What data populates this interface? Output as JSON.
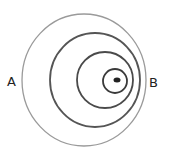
{
  "diagram": {
    "type": "nested-eccentric-circles",
    "labels": {
      "left": "A",
      "right": "B"
    },
    "circles": [
      {
        "name": "outer",
        "cx": 84,
        "cy": 80,
        "rx": 62,
        "ry": 66,
        "stroke": "#9a9a9a",
        "width": 1.3
      },
      {
        "name": "second",
        "cx": 95,
        "cy": 80,
        "rx": 45,
        "ry": 47,
        "stroke": "#555555",
        "width": 1.8
      },
      {
        "name": "third",
        "cx": 105,
        "cy": 80,
        "rx": 28,
        "ry": 28,
        "stroke": "#4a4a4a",
        "width": 1.8
      },
      {
        "name": "inner",
        "cx": 115,
        "cy": 81,
        "rx": 12,
        "ry": 12,
        "stroke": "#3a3a3a",
        "width": 1.8
      }
    ],
    "center_dot": {
      "cx": 117,
      "cy": 80,
      "rx": 3.5,
      "ry": 2.5,
      "fill": "#222222"
    }
  }
}
